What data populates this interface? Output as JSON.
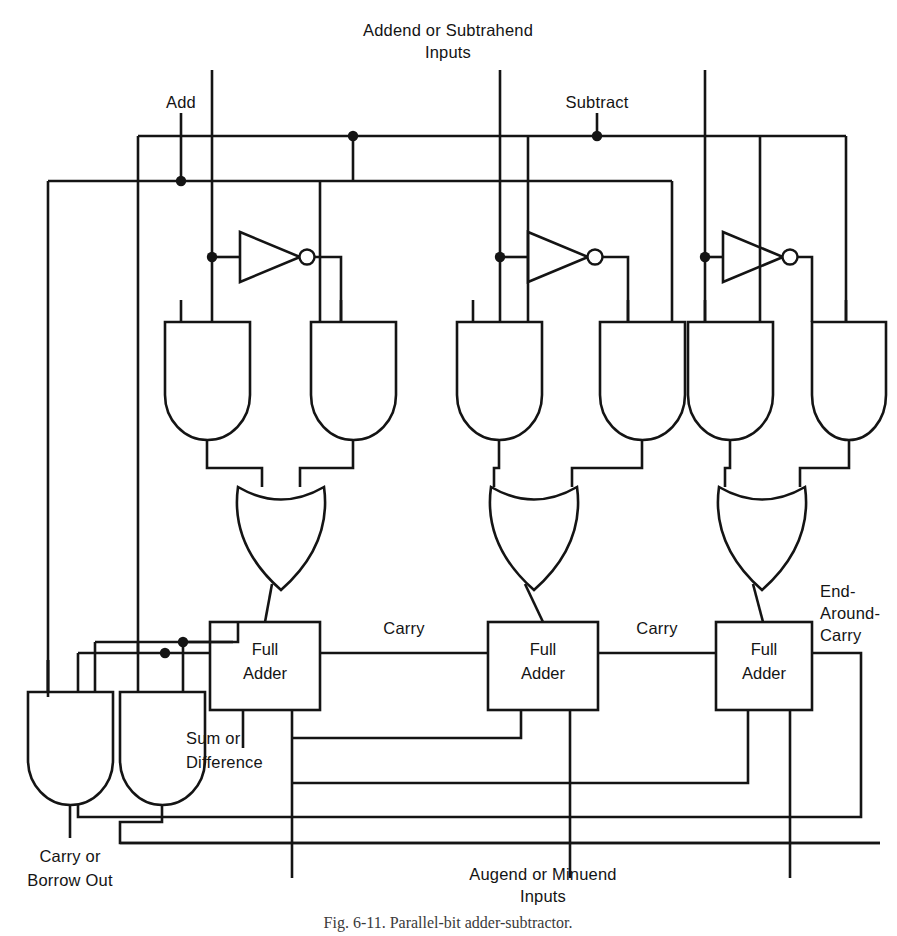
{
  "figure": {
    "caption": "Fig. 6-11.  Parallel-bit adder-subtractor.",
    "ink_color": "#141414",
    "background_color": "#ffffff"
  },
  "labels": {
    "add": "Add",
    "subtract": "Subtract",
    "addend_line1": "Addend or Subtrahend",
    "addend_line2": "Inputs",
    "augend_line1": "Augend or Minuend",
    "augend_line2": "Inputs",
    "carry_1": "Carry",
    "carry_2": "Carry",
    "eac_line1": "End-",
    "eac_line2": "Around-",
    "eac_line3": "Carry",
    "sum_line1": "Sum or",
    "sum_line2": "Difference",
    "carryout_line1": "Carry or",
    "carryout_line2": "Borrow Out"
  },
  "blocks": [
    {
      "id": "fa1",
      "line1": "Full",
      "line2": "Adder"
    },
    {
      "id": "fa2",
      "line1": "Full",
      "line2": "Adder"
    },
    {
      "id": "fa3",
      "line1": "Full",
      "line2": "Adder"
    }
  ],
  "gates": {
    "and_count_top": 6,
    "and_count_bottom": 2,
    "or_count": 3,
    "inverter_count": 3
  }
}
